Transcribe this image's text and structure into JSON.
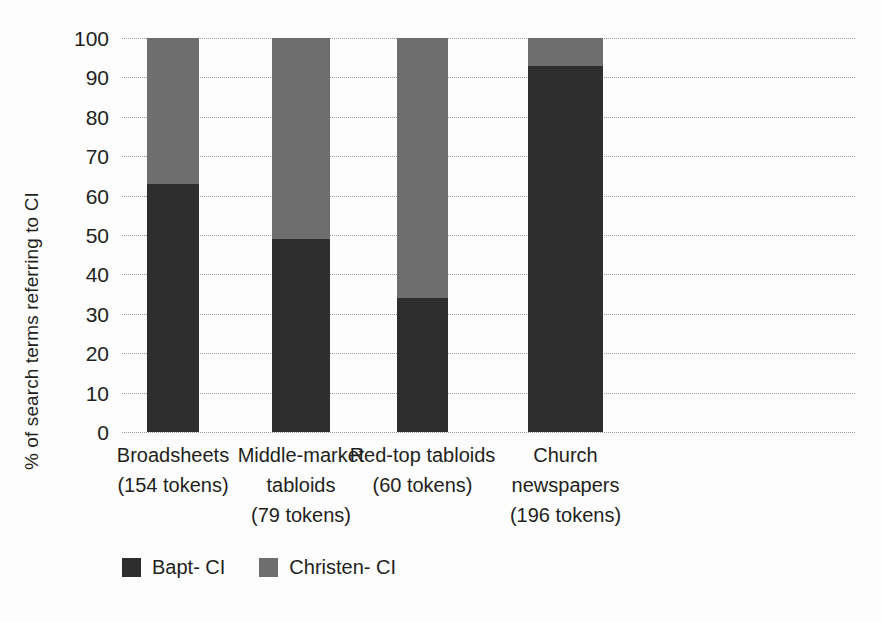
{
  "chart_data": {
    "type": "bar",
    "subtype": "stacked-100",
    "title": "",
    "xlabel": "",
    "ylabel": "% of search terms referring to CI",
    "ylim": [
      0,
      100
    ],
    "yticks": [
      0,
      10,
      20,
      30,
      40,
      50,
      60,
      70,
      80,
      90,
      100
    ],
    "ytick_labels": [
      "0",
      "10",
      "20",
      "30",
      "40",
      "50",
      "60",
      "70",
      "80",
      "90",
      "100"
    ],
    "grid": true,
    "grid_style": "dotted-horizontal",
    "legend_position": "bottom-left",
    "categories": [
      "Broadsheets\n(154 tokens)",
      "Middle-market tabloids\n(79 tokens)",
      "Red-top tabloids\n(60 tokens)",
      "Church newspapers\n(196 tokens)"
    ],
    "category_lines": [
      [
        "Broadsheets",
        "(154 tokens)"
      ],
      [
        "Middle-market",
        "tabloids",
        "(79 tokens)"
      ],
      [
        "Red-top tabloids",
        "(60 tokens)"
      ],
      [
        "Church",
        "newspapers",
        "(196 tokens)"
      ]
    ],
    "series": [
      {
        "name": "Bapt- CI",
        "color": "#2e2e2e",
        "values": [
          63,
          49,
          34,
          93
        ]
      },
      {
        "name": "Christen- CI",
        "color": "#6e6e6e",
        "values": [
          37,
          51,
          66,
          7
        ]
      }
    ]
  },
  "legend": {
    "items": [
      {
        "label": "Bapt- CI",
        "color": "#2e2e2e"
      },
      {
        "label": "Christen- CI",
        "color": "#6e6e6e"
      }
    ]
  }
}
